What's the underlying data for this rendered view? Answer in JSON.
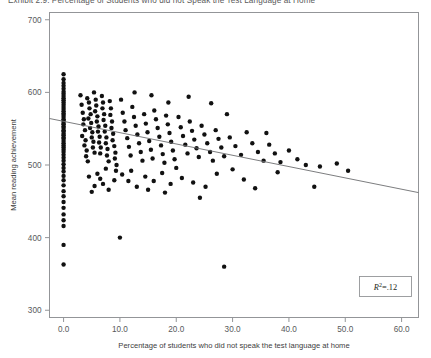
{
  "figure": {
    "title_clipped": "Exhibit 2.9: Percentage of Students who did not Speak the Test Language at Home"
  },
  "chart_data": {
    "type": "scatter",
    "title": "",
    "xlabel": "Percentage of students who did not speak the test language at home",
    "ylabel": "Mean reading achievement",
    "xlim": [
      -2.5,
      63.0
    ],
    "ylim": [
      290,
      710
    ],
    "xticks": [
      "0.0",
      "10.0",
      "20.0",
      "30.0",
      "40.0",
      "50.0",
      "60.0"
    ],
    "xtick_values": [
      0,
      10,
      20,
      30,
      40,
      50,
      60
    ],
    "yticks": [
      "300",
      "400",
      "500",
      "600",
      "700"
    ],
    "ytick_values": [
      300,
      400,
      500,
      600,
      700
    ],
    "grid": false,
    "legend": null,
    "annotations": [
      {
        "name": "r-squared-box",
        "text": "R2=.12",
        "symbol": "R",
        "superscript": "2",
        "value": "=.12",
        "x": 52.0,
        "y": 325
      }
    ],
    "trendline": {
      "type": "linear",
      "x0": -2.5,
      "y0": 564,
      "x1": 63.0,
      "y1": 462,
      "color": "#6d6e71"
    },
    "marker": {
      "shape": "circle",
      "size": 2.2,
      "color": "#111111"
    },
    "points": [
      [
        0.0,
        625
      ],
      [
        0.0,
        618
      ],
      [
        0.0,
        613
      ],
      [
        0.0,
        609
      ],
      [
        0.0,
        605
      ],
      [
        0.0,
        601
      ],
      [
        0.0,
        598
      ],
      [
        0.0,
        595
      ],
      [
        0.0,
        592
      ],
      [
        0.0,
        589
      ],
      [
        0.0,
        586
      ],
      [
        0.0,
        583
      ],
      [
        0.0,
        580
      ],
      [
        0.0,
        577
      ],
      [
        0.0,
        574
      ],
      [
        0.0,
        571
      ],
      [
        0.0,
        569
      ],
      [
        0.0,
        566
      ],
      [
        0.0,
        563
      ],
      [
        0.0,
        561
      ],
      [
        0.0,
        558
      ],
      [
        0.0,
        556
      ],
      [
        0.0,
        553
      ],
      [
        0.0,
        551
      ],
      [
        0.0,
        548
      ],
      [
        0.0,
        546
      ],
      [
        0.0,
        543
      ],
      [
        0.0,
        541
      ],
      [
        0.0,
        538
      ],
      [
        0.0,
        536
      ],
      [
        0.0,
        533
      ],
      [
        0.0,
        530
      ],
      [
        0.0,
        527
      ],
      [
        0.0,
        524
      ],
      [
        0.0,
        521
      ],
      [
        0.0,
        518
      ],
      [
        0.0,
        514
      ],
      [
        0.0,
        510
      ],
      [
        0.0,
        506
      ],
      [
        0.0,
        501
      ],
      [
        0.0,
        496
      ],
      [
        0.0,
        491
      ],
      [
        0.0,
        485
      ],
      [
        0.0,
        479
      ],
      [
        0.0,
        472
      ],
      [
        0.0,
        464
      ],
      [
        0.0,
        457
      ],
      [
        0.0,
        449
      ],
      [
        0.0,
        441
      ],
      [
        0.0,
        432
      ],
      [
        0.0,
        424
      ],
      [
        0.0,
        416
      ],
      [
        0.0,
        390
      ],
      [
        0.0,
        363
      ],
      [
        3.0,
        596
      ],
      [
        3.2,
        583
      ],
      [
        3.4,
        572
      ],
      [
        3.6,
        563
      ],
      [
        3.5,
        556
      ],
      [
        3.8,
        548
      ],
      [
        3.3,
        540
      ],
      [
        3.9,
        534
      ],
      [
        3.7,
        527
      ],
      [
        4.1,
        520
      ],
      [
        4.0,
        512
      ],
      [
        4.3,
        505
      ],
      [
        4.2,
        592
      ],
      [
        4.5,
        586
      ],
      [
        4.6,
        578
      ],
      [
        4.8,
        570
      ],
      [
        4.4,
        564
      ],
      [
        4.9,
        558
      ],
      [
        4.7,
        551
      ],
      [
        5.1,
        545
      ],
      [
        5.0,
        538
      ],
      [
        5.3,
        532
      ],
      [
        5.2,
        524
      ],
      [
        5.5,
        517
      ],
      [
        5.4,
        600
      ],
      [
        5.7,
        590
      ],
      [
        5.8,
        582
      ],
      [
        5.6,
        574
      ],
      [
        6.0,
        567
      ],
      [
        5.9,
        560
      ],
      [
        6.2,
        553
      ],
      [
        6.1,
        546
      ],
      [
        6.4,
        539
      ],
      [
        6.3,
        531
      ],
      [
        6.6,
        524
      ],
      [
        6.5,
        516
      ],
      [
        6.8,
        595
      ],
      [
        7.0,
        586
      ],
      [
        6.9,
        578
      ],
      [
        7.2,
        570
      ],
      [
        7.1,
        562
      ],
      [
        7.4,
        554
      ],
      [
        7.3,
        546
      ],
      [
        7.6,
        538
      ],
      [
        7.5,
        530
      ],
      [
        7.8,
        522
      ],
      [
        7.7,
        513
      ],
      [
        8.0,
        505
      ],
      [
        8.2,
        588
      ],
      [
        8.4,
        578
      ],
      [
        8.3,
        569
      ],
      [
        8.6,
        560
      ],
      [
        8.5,
        551
      ],
      [
        8.8,
        543
      ],
      [
        8.7,
        534
      ],
      [
        9.0,
        526
      ],
      [
        9.2,
        517
      ],
      [
        9.1,
        509
      ],
      [
        9.4,
        500
      ],
      [
        9.3,
        492
      ],
      [
        6.0,
        488
      ],
      [
        6.5,
        481
      ],
      [
        7.0,
        474
      ],
      [
        7.5,
        495
      ],
      [
        8.0,
        466
      ],
      [
        9.0,
        479
      ],
      [
        5.5,
        471
      ],
      [
        4.5,
        484
      ],
      [
        5.0,
        463
      ],
      [
        10.0,
        400
      ],
      [
        10.2,
        590
      ],
      [
        10.5,
        572
      ],
      [
        10.8,
        560
      ],
      [
        11.0,
        548
      ],
      [
        11.3,
        537
      ],
      [
        11.6,
        525
      ],
      [
        11.9,
        513
      ],
      [
        12.2,
        580
      ],
      [
        12.5,
        566
      ],
      [
        12.8,
        554
      ],
      [
        13.1,
        542
      ],
      [
        13.4,
        530
      ],
      [
        13.7,
        518
      ],
      [
        14.0,
        506
      ],
      [
        14.3,
        570
      ],
      [
        14.6,
        557
      ],
      [
        14.9,
        545
      ],
      [
        15.2,
        533
      ],
      [
        15.5,
        521
      ],
      [
        15.8,
        509
      ],
      [
        16.1,
        575
      ],
      [
        16.4,
        563
      ],
      [
        16.7,
        551
      ],
      [
        17.0,
        539
      ],
      [
        17.3,
        527
      ],
      [
        17.6,
        515
      ],
      [
        17.9,
        503
      ],
      [
        18.2,
        568
      ],
      [
        18.5,
        556
      ],
      [
        18.8,
        544
      ],
      [
        19.1,
        532
      ],
      [
        19.4,
        520
      ],
      [
        19.7,
        508
      ],
      [
        20.0,
        496
      ],
      [
        10.4,
        487
      ],
      [
        11.5,
        478
      ],
      [
        12.0,
        492
      ],
      [
        13.0,
        470
      ],
      [
        14.5,
        484
      ],
      [
        15.0,
        466
      ],
      [
        16.0,
        478
      ],
      [
        17.5,
        489
      ],
      [
        18.0,
        462
      ],
      [
        19.0,
        474
      ],
      [
        12.6,
        600
      ],
      [
        15.6,
        596
      ],
      [
        18.6,
        586
      ],
      [
        20.4,
        566
      ],
      [
        20.8,
        552
      ],
      [
        21.2,
        540
      ],
      [
        21.6,
        528
      ],
      [
        22.0,
        516
      ],
      [
        22.4,
        560
      ],
      [
        22.8,
        547
      ],
      [
        23.2,
        535
      ],
      [
        23.6,
        523
      ],
      [
        24.0,
        511
      ],
      [
        24.5,
        554
      ],
      [
        25.0,
        542
      ],
      [
        25.5,
        530
      ],
      [
        26.0,
        518
      ],
      [
        26.5,
        506
      ],
      [
        27.0,
        548
      ],
      [
        27.5,
        536
      ],
      [
        28.0,
        524
      ],
      [
        28.5,
        512
      ],
      [
        21.0,
        482
      ],
      [
        23.0,
        476
      ],
      [
        25.2,
        470
      ],
      [
        27.2,
        488
      ],
      [
        24.2,
        455
      ],
      [
        22.2,
        594
      ],
      [
        26.2,
        585
      ],
      [
        28.5,
        360
      ],
      [
        29.5,
        538
      ],
      [
        30.5,
        526
      ],
      [
        31.5,
        514
      ],
      [
        32.5,
        545
      ],
      [
        33.5,
        530
      ],
      [
        34.5,
        518
      ],
      [
        35.5,
        506
      ],
      [
        30.0,
        494
      ],
      [
        32.0,
        480
      ],
      [
        34.0,
        468
      ],
      [
        29.0,
        570
      ],
      [
        36.5,
        528
      ],
      [
        37.5,
        516
      ],
      [
        38.5,
        504
      ],
      [
        36.0,
        544
      ],
      [
        38.0,
        490
      ],
      [
        40.0,
        520
      ],
      [
        41.5,
        508
      ],
      [
        43.0,
        500
      ],
      [
        44.5,
        470
      ],
      [
        45.5,
        498
      ],
      [
        48.5,
        502
      ],
      [
        50.5,
        492
      ]
    ]
  }
}
